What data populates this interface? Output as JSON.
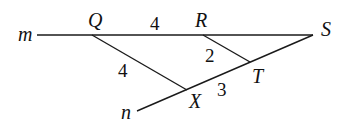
{
  "diagram": {
    "points": {
      "m": "m",
      "Q": "Q",
      "R": "R",
      "S": "S",
      "T": "T",
      "X": "X",
      "n": "n"
    },
    "lengths": {
      "QR": "4",
      "QX": "4",
      "RT": "2",
      "XT": "3"
    }
  }
}
